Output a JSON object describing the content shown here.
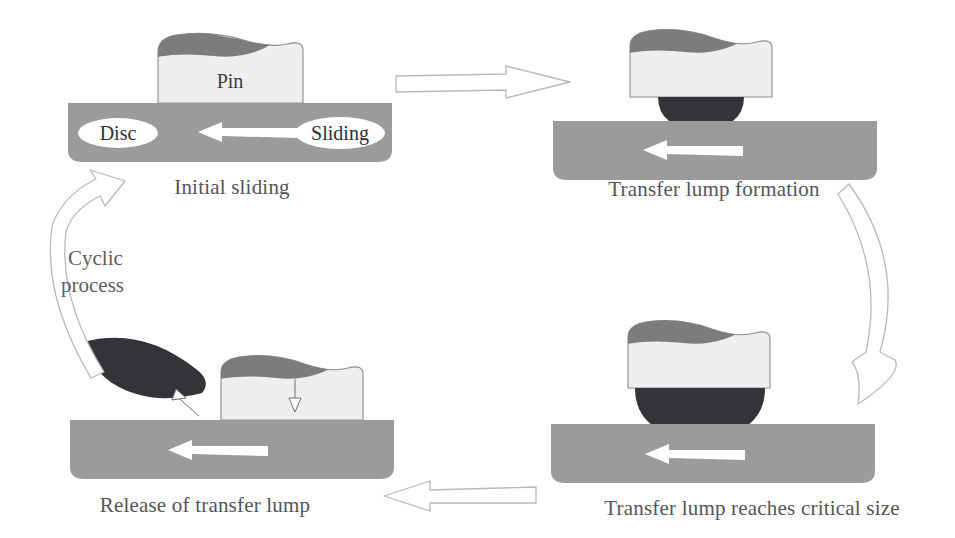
{
  "figure": {
    "type": "process-cycle-diagram",
    "background_color": "#ffffff"
  },
  "colors": {
    "disc_gray": "#9b9b9b",
    "pin_fill": "#eeeeee",
    "pin_outline": "#8d8d8d",
    "pin_cap_gray": "#7c7c7c",
    "lump_dark": "#333338",
    "caption_text": "#55545a",
    "arrow_outline": "#b9b9bd",
    "white_arrow": "#ffffff"
  },
  "stages": [
    {
      "id": "stage-initial-sliding",
      "caption": "Initial sliding",
      "labels": {
        "pin": "Pin",
        "disc": "Disc",
        "sliding": "Sliding"
      },
      "position": "top-left"
    },
    {
      "id": "stage-transfer-lump-formation",
      "caption": "Transfer lump formation",
      "labels": {},
      "position": "top-right"
    },
    {
      "id": "stage-critical-size",
      "caption": "Transfer lump reaches critical size",
      "labels": {},
      "position": "bottom-right"
    },
    {
      "id": "stage-release",
      "caption": "Release of transfer lump",
      "labels": {},
      "position": "bottom-left"
    }
  ],
  "cycle_label": {
    "line1": "Cyclic",
    "line2": "process"
  },
  "connectors": [
    {
      "id": "connector-top",
      "from": "stage-initial-sliding",
      "to": "stage-transfer-lump-formation",
      "direction": "right",
      "style": "straight-outline-arrow"
    },
    {
      "id": "connector-right",
      "from": "stage-transfer-lump-formation",
      "to": "stage-critical-size",
      "direction": "down",
      "style": "curved-outline-arrow"
    },
    {
      "id": "connector-bottom",
      "from": "stage-critical-size",
      "to": "stage-release",
      "direction": "left",
      "style": "straight-outline-arrow"
    },
    {
      "id": "connector-left",
      "from": "stage-release",
      "to": "stage-initial-sliding",
      "direction": "up",
      "style": "curved-outline-arrow"
    }
  ],
  "sliding_direction_arrows": {
    "description": "white arrow inside disc pointing left",
    "count": 4,
    "direction": "left"
  }
}
